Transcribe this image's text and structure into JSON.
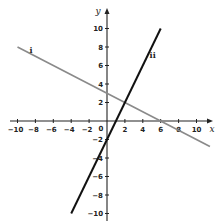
{
  "chart_data": {
    "type": "line",
    "title": "",
    "xlabel": "x",
    "ylabel": "y",
    "xlim": [
      -10,
      11
    ],
    "ylim": [
      -10,
      10.5
    ],
    "grid": false,
    "x_ticks": [
      -10,
      -8,
      -6,
      -4,
      -2,
      2,
      4,
      6,
      8,
      10
    ],
    "y_ticks": [
      -10,
      -8,
      -6,
      -4,
      -2,
      2,
      4,
      6,
      8,
      10
    ],
    "origin_label": "0",
    "series": [
      {
        "name": "i",
        "equation": "y = -x/2 + 3",
        "color": "#8a8a8a",
        "x": [
          -10,
          11.5
        ],
        "y": [
          8,
          -2.75
        ]
      },
      {
        "name": "ii",
        "equation": "y = 2x - 2",
        "color": "#111111",
        "x": [
          -4,
          6
        ],
        "y": [
          -10,
          10
        ]
      }
    ],
    "annotations": [
      {
        "text": "i",
        "x": -8.5,
        "y": 7.3
      },
      {
        "text": "ii",
        "x": 5.1,
        "y": 6.8
      }
    ],
    "intersection": {
      "x": 2,
      "y": 2
    }
  }
}
